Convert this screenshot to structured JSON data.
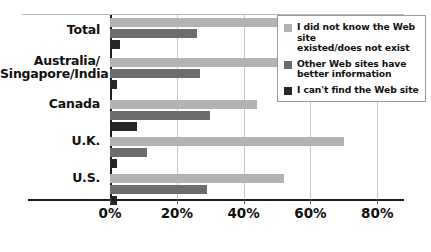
{
  "chart_data": {
    "type": "bar",
    "orientation": "horizontal",
    "title": "",
    "xlabel": "",
    "ylabel": "",
    "xlim": [
      0,
      88
    ],
    "grid": true,
    "legend_position": "top-right",
    "categories": [
      "Total",
      "Australia/ Singapore/India",
      "Canada",
      "U.K.",
      "U.S."
    ],
    "category_lines": [
      [
        "Total"
      ],
      [
        "Australia/",
        "Singapore/India"
      ],
      [
        "Canada"
      ],
      [
        "U.K."
      ],
      [
        "U.S."
      ]
    ],
    "tick_labels": [
      "0%",
      "20%",
      "40%",
      "60%",
      "80%"
    ],
    "tick_values": [
      0,
      20,
      40,
      60,
      80
    ],
    "series": [
      {
        "name": "I did not know the Web site existed/does not exist",
        "name_lines": [
          "I did not know the Web site",
          "existed/does not exist"
        ],
        "color": "#b3b3b3",
        "values": [
          55,
          53,
          44,
          70,
          52
        ]
      },
      {
        "name": "Other Web sites have better information",
        "name_lines": [
          "Other Web sites have",
          "better information"
        ],
        "color": "#6d6d6d",
        "values": [
          26,
          27,
          30,
          11,
          29
        ]
      },
      {
        "name": "I can't find the Web site",
        "name_lines": [
          "I can't find the Web site"
        ],
        "color": "#262626",
        "values": [
          3,
          2,
          8,
          2,
          2
        ]
      }
    ]
  }
}
